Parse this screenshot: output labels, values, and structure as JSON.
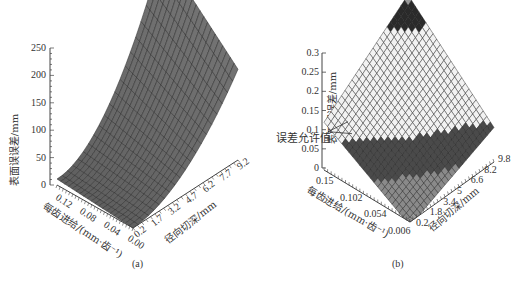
{
  "chart_data": [
    {
      "type": "surface3d",
      "panel": "(a)",
      "zlabel": "表面误误差/mm",
      "xlabel": "每齿进给/(mm·齿⁻¹)",
      "ylabel": "径向切深/mm",
      "z_ticks": [
        "0",
        "50",
        "100",
        "150",
        "200",
        "250"
      ],
      "zlim": [
        0,
        250
      ],
      "x_ticks": [
        "0.12",
        "0.08",
        "0.04",
        "0.00"
      ],
      "y_ticks": [
        "0.2",
        "1.7",
        "3.2",
        "4.7",
        "6.2",
        "7.7",
        "9.2"
      ],
      "description": "Surface rising steeply toward max feed and max radial depth; peak ≈ 280 mm at feed 0.00 corner / depth 9.2, near 0 at low depth",
      "surface_color": "#6e6e6e"
    },
    {
      "type": "surface3d",
      "panel": "(b)",
      "zlabel": "表面误误差/mm",
      "xlabel": "每齿进给/(mm·齿⁻¹)",
      "ylabel": "径向切深/mm",
      "z_ticks": [
        "0",
        "0.05",
        "0.1",
        "0.15",
        "0.2",
        "0.25",
        "0.3"
      ],
      "zlim": [
        0,
        0.3
      ],
      "x_ticks": [
        "0.15",
        "0.102",
        "0.054",
        "0.006"
      ],
      "y_ticks": [
        "0.2",
        "1.8",
        "3.4",
        "5",
        "6.6",
        "8.2",
        "9.8"
      ],
      "annotation": "误差允许值",
      "annotation_value": 0.1,
      "bands": [
        {
          "range": [
            0,
            0.05
          ],
          "color": "#8a8a8a"
        },
        {
          "range": [
            0.05,
            0.1
          ],
          "color": "#4a4a4a"
        },
        {
          "range": [
            0.1,
            0.25
          ],
          "color": "#f2f2f2"
        },
        {
          "range": [
            0.25,
            0.29
          ],
          "color": "#2a2a2a"
        },
        {
          "range": [
            0.29,
            0.32
          ],
          "color": "#9a9a9a"
        }
      ]
    }
  ],
  "captions": {
    "a": "(a)",
    "b": "(b)"
  }
}
